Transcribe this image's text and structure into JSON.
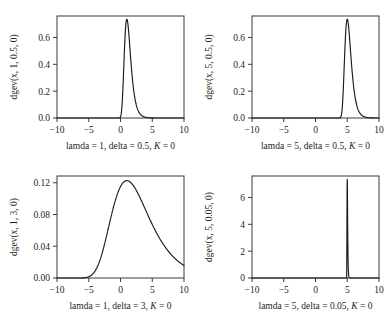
{
  "figure": {
    "title": "",
    "background": "#ffffff",
    "curve_color": "#1a1a1a",
    "axis_color": "#3b3b3b",
    "layout": "2x2 grid of GEV density panels"
  },
  "chart_data": [
    {
      "type": "line",
      "panel": "top-left",
      "title": "",
      "xlabel": "lamda = 1, delta = 0.5, K = 0",
      "xlabel_parts": {
        "pre": "lamda = 1, delta = 0.5, ",
        "italic": "K",
        "post": " = 0"
      },
      "ylabel": "dgev(x, 1, 0.5, 0)",
      "xlim": [
        -10,
        10
      ],
      "ylim": [
        0,
        0.76
      ],
      "xticks": [
        -10,
        -5,
        0,
        5,
        10
      ],
      "xticklabels": [
        "−10",
        "−5",
        "0",
        "5",
        "10"
      ],
      "yticks": [
        0.0,
        0.2,
        0.4,
        0.6
      ],
      "yticklabels": [
        "0.0",
        "0.2",
        "0.4",
        "0.6"
      ],
      "grid": false,
      "legend": "none",
      "distribution": {
        "name": "gev",
        "lamda": 1,
        "delta": 0.5,
        "K": 0
      },
      "peak": {
        "x": 1,
        "y": 0.7358
      }
    },
    {
      "type": "line",
      "panel": "top-right",
      "title": "",
      "xlabel": "lamda = 5, delta = 0.5, K = 0",
      "xlabel_parts": {
        "pre": "lamda = 5, delta = 0.5, ",
        "italic": "K",
        "post": " = 0"
      },
      "ylabel": "dgev(x, 5, 0.5, 0)",
      "xlim": [
        -10,
        10
      ],
      "ylim": [
        0,
        0.76
      ],
      "xticks": [
        -10,
        -5,
        0,
        5,
        10
      ],
      "xticklabels": [
        "−10",
        "−5",
        "0",
        "5",
        "10"
      ],
      "yticks": [
        0.0,
        0.2,
        0.4,
        0.6
      ],
      "yticklabels": [
        "0.0",
        "0.2",
        "0.4",
        "0.6"
      ],
      "grid": false,
      "legend": "none",
      "distribution": {
        "name": "gev",
        "lamda": 5,
        "delta": 0.5,
        "K": 0
      },
      "peak": {
        "x": 5,
        "y": 0.7358
      }
    },
    {
      "type": "line",
      "panel": "bottom-left",
      "title": "",
      "xlabel": "lamda = 1, delta = 3, K = 0",
      "xlabel_parts": {
        "pre": "lamda = 1, delta = 3, ",
        "italic": "K",
        "post": " = 0"
      },
      "ylabel": "dgev(x, 1, 3, 0)",
      "xlim": [
        -10,
        10
      ],
      "ylim": [
        0,
        0.1285
      ],
      "xticks": [
        -10,
        -5,
        0,
        5,
        10
      ],
      "xticklabels": [
        "−10",
        "−5",
        "0",
        "5",
        "10"
      ],
      "yticks": [
        0.0,
        0.04,
        0.08,
        0.12
      ],
      "yticklabels": [
        "0.00",
        "0.04",
        "0.08",
        "0.12"
      ],
      "grid": false,
      "legend": "none",
      "distribution": {
        "name": "gev",
        "lamda": 1,
        "delta": 3,
        "K": 0
      },
      "peak": {
        "x": 1,
        "y": 0.1226
      }
    },
    {
      "type": "line",
      "panel": "bottom-right",
      "title": "",
      "xlabel": "lamda = 5, delta = 0.05, K = 0",
      "xlabel_parts": {
        "pre": "lamda = 5, delta = 0.05, ",
        "italic": "K",
        "post": " = 0"
      },
      "ylabel": "dgev(x, 5, 0.05, 0)",
      "xlim": [
        -10,
        10
      ],
      "ylim": [
        0,
        7.6
      ],
      "xticks": [
        -10,
        -5,
        0,
        5,
        10
      ],
      "xticklabels": [
        "−10",
        "−5",
        "0",
        "5",
        "10"
      ],
      "yticks": [
        0,
        2,
        4,
        6
      ],
      "yticklabels": [
        "0",
        "2",
        "4",
        "6"
      ],
      "grid": false,
      "legend": "none",
      "distribution": {
        "name": "gev",
        "lamda": 5,
        "delta": 0.05,
        "K": 0
      },
      "peak": {
        "x": 5,
        "y": 7.358
      }
    }
  ]
}
